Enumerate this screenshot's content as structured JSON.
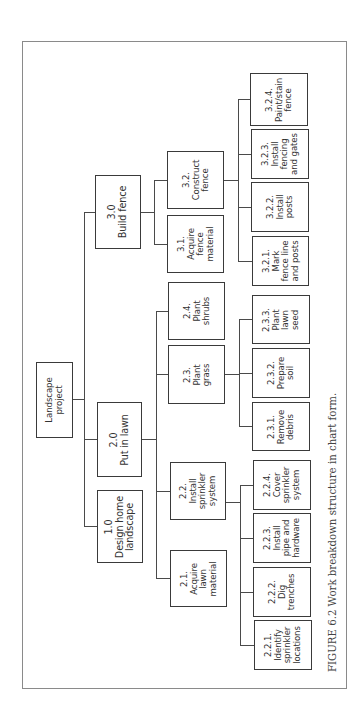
{
  "figure": {
    "caption": "FIGURE 6.2  Work breakdown structure in chart form.",
    "orientation": "rotated 90° counter-clockwise (text reads bottom to top)"
  },
  "wbs": {
    "root": {
      "id": "root",
      "label": "Landscape\nproject"
    },
    "level1": [
      {
        "id": "1.0",
        "label": "1.0\nDesign home\nlandscape"
      },
      {
        "id": "2.0",
        "label": "2.0\nPut in lawn"
      },
      {
        "id": "3.0",
        "label": "3.0\nBuild fence"
      }
    ],
    "level2": [
      {
        "id": "2.1",
        "parent": "2.0",
        "label": "2.1.\nAcquire\nlawn\nmaterial"
      },
      {
        "id": "2.2",
        "parent": "2.0",
        "label": "2.2.\nInstall\nsprinkler\nsystem"
      },
      {
        "id": "2.3",
        "parent": "2.0",
        "label": "2.3.\nPlant\ngrass"
      },
      {
        "id": "2.4",
        "parent": "2.0",
        "label": "2.4.\nPlant\nshrubs"
      },
      {
        "id": "3.1",
        "parent": "3.0",
        "label": "3.1.\nAcquire\nfence\nmaterial"
      },
      {
        "id": "3.2",
        "parent": "3.0",
        "label": "3.2.\nConstruct\nfence"
      }
    ],
    "level3": [
      {
        "id": "2.2.1",
        "parent": "2.2",
        "label": "2.2.1.\nIdentify\nsprinkler\nlocations"
      },
      {
        "id": "2.2.2",
        "parent": "2.2",
        "label": "2.2.2.\nDig\ntrenches"
      },
      {
        "id": "2.2.3",
        "parent": "2.2",
        "label": "2.2.3.\nInstall\npipe and\nhardware"
      },
      {
        "id": "2.2.4",
        "parent": "2.2",
        "label": "2.2.4.\nCover\nsprinkler\nsystem"
      },
      {
        "id": "2.3.1",
        "parent": "2.3",
        "label": "2.3.1.\nRemove\ndebris"
      },
      {
        "id": "2.3.2",
        "parent": "2.3",
        "label": "2.3.2.\nPrepare\nsoil"
      },
      {
        "id": "2.3.3",
        "parent": "2.3",
        "label": "2.3.3.\nPlant\nlawn\nseed"
      },
      {
        "id": "3.2.1",
        "parent": "3.2",
        "label": "3.2.1.\nMark\nfence line\nand posts"
      },
      {
        "id": "3.2.2",
        "parent": "3.2",
        "label": "3.2.2.\nInstall\nposts"
      },
      {
        "id": "3.2.3",
        "parent": "3.2",
        "label": "3.2.3.\nInstall\nfencing\nand gates"
      },
      {
        "id": "3.2.4",
        "parent": "3.2",
        "label": "3.2.4.\nPaint/stain\nfence"
      }
    ]
  },
  "colors": {
    "stroke": "#3a3a3a",
    "text": "#333333",
    "frame": "#8a8a8a",
    "background": "#ffffff"
  }
}
